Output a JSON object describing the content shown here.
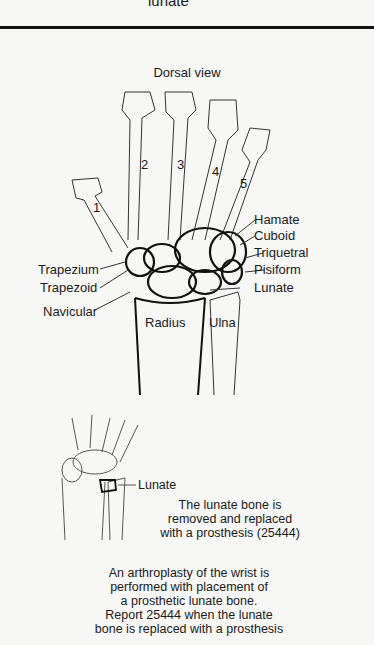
{
  "header": {
    "partial_text": "lunate"
  },
  "main_figure": {
    "title": "Dorsal view",
    "digits": [
      "1",
      "2",
      "3",
      "4",
      "5"
    ],
    "labels_right": [
      "Hamate",
      "Cuboid",
      "Triquetral",
      "Pisiform",
      "Lunate"
    ],
    "labels_left": [
      "Trapezium",
      "Trapezoid",
      "Navicular"
    ],
    "forearm": [
      "Radius",
      "Ulna"
    ]
  },
  "inset_figure": {
    "digits": [
      "1",
      "2",
      "3",
      "4",
      "5"
    ],
    "label": "Lunate",
    "caption": [
      "The lunate bone is",
      "removed and replaced",
      "with a prosthesis (25444)"
    ]
  },
  "description": [
    "An arthroplasty of the wrist is",
    "performed with placement of",
    "a prosthetic lunate bone.",
    "Report 25444 when the lunate",
    "bone is replaced with a prosthesis"
  ],
  "colors": {
    "background": "#f7f7f5",
    "ink": "#1a1a1a"
  }
}
